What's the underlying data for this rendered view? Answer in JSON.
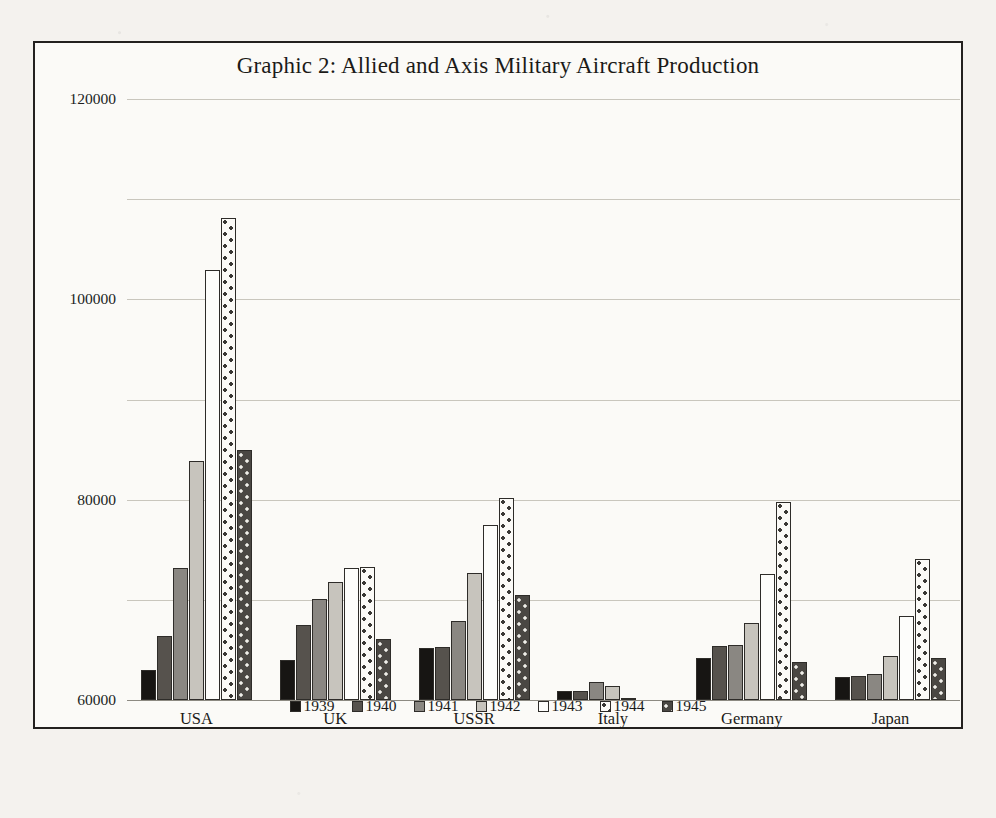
{
  "chart_data": {
    "type": "bar",
    "title": "Graphic 2: Allied and Axis Military Aircraft Production",
    "xlabel": "",
    "ylabel": "",
    "ylim": [
      0,
      120000
    ],
    "ytick_values": [
      120000,
      100000,
      80000,
      60000,
      40000,
      20000,
      0
    ],
    "ytick_labels": [
      "120000",
      "100000",
      "80000",
      "60000",
      "40000",
      "20000",
      "0"
    ],
    "grid": true,
    "legend_position": "bottom",
    "categories": [
      "USA",
      "UK",
      "USSR",
      "Italy",
      "Germany",
      "Japan"
    ],
    "series": [
      {
        "name": "1939",
        "color": "#171513",
        "values": [
          5900,
          7900,
          10400,
          1800,
          8300,
          4500
        ]
      },
      {
        "name": "1940",
        "color": "#56524d",
        "values": [
          12800,
          15000,
          10600,
          1800,
          10800,
          4800
        ]
      },
      {
        "name": "1941",
        "color": "#8a8782",
        "values": [
          26300,
          20100,
          15700,
          3500,
          11000,
          5100
        ]
      },
      {
        "name": "1942",
        "color": "#c7c4bd",
        "values": [
          47800,
          23600,
          25400,
          2800,
          15400,
          8800
        ]
      },
      {
        "name": "1943",
        "color": "#fdfdfb",
        "values": [
          85900,
          26300,
          34900,
          500,
          25200,
          16700
        ]
      },
      {
        "name": "1944",
        "color": "#fbfaf7",
        "values": [
          96300,
          26500,
          40300,
          0,
          39600,
          28200
        ]
      },
      {
        "name": "1945",
        "color": "#4a4743",
        "values": [
          49900,
          12100,
          20900,
          0,
          7500,
          8300
        ]
      }
    ]
  }
}
